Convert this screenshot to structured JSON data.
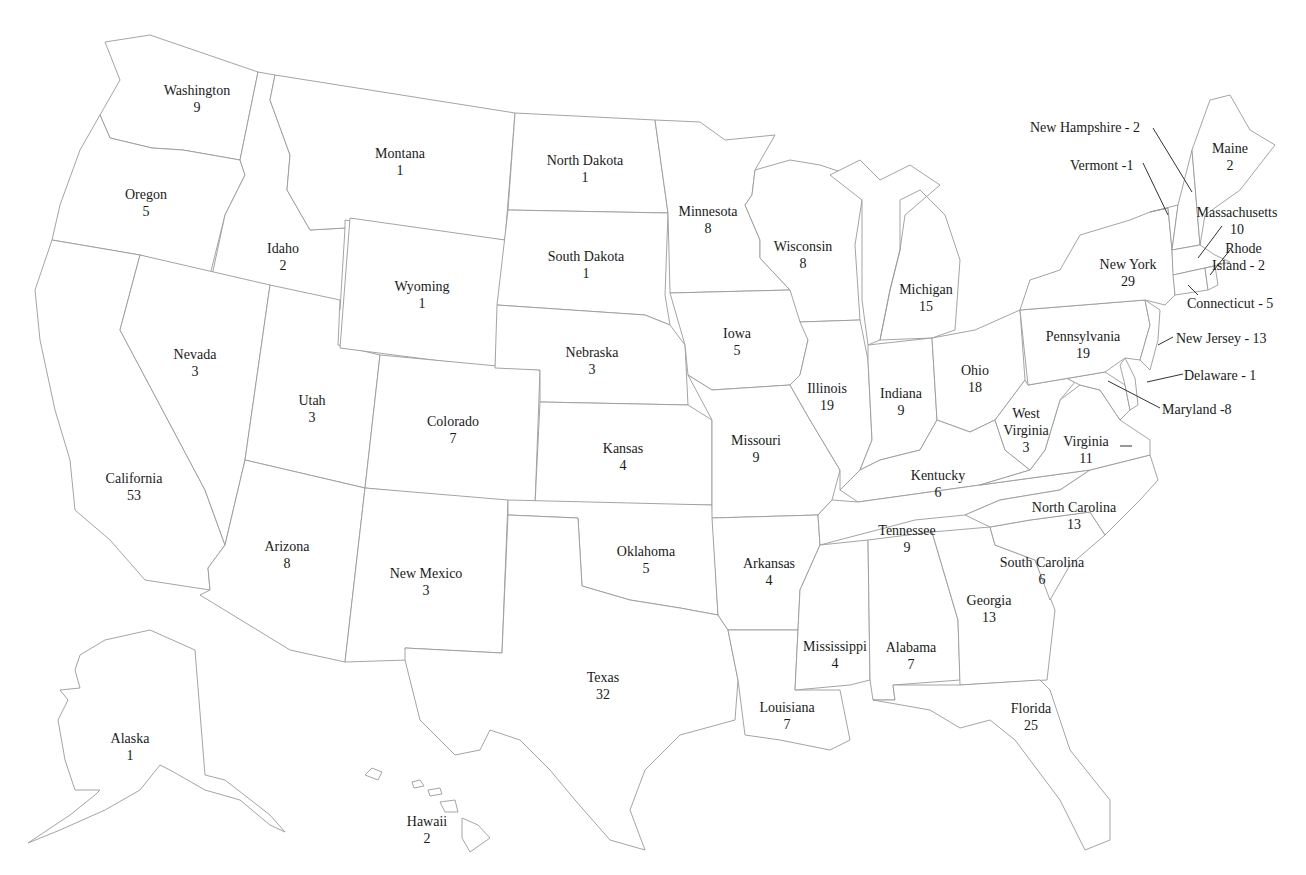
{
  "map": {
    "title": "US Electoral Votes by State",
    "states": [
      {
        "id": "WA",
        "name": "Washington",
        "votes": "9",
        "x": 197,
        "y": 82
      },
      {
        "id": "OR",
        "name": "Oregon",
        "votes": "5",
        "x": 146,
        "y": 186
      },
      {
        "id": "ID",
        "name": "Idaho",
        "votes": "2",
        "x": 283,
        "y": 240
      },
      {
        "id": "MT",
        "name": "Montana",
        "votes": "1",
        "x": 400,
        "y": 145
      },
      {
        "id": "WY",
        "name": "Wyoming",
        "votes": "1",
        "x": 422,
        "y": 278
      },
      {
        "id": "ND",
        "name": "North Dakota",
        "votes": "1",
        "x": 585,
        "y": 152
      },
      {
        "id": "SD",
        "name": "South Dakota",
        "votes": "1",
        "x": 586,
        "y": 248
      },
      {
        "id": "NE",
        "name": "Nebraska",
        "votes": "3",
        "x": 592,
        "y": 344
      },
      {
        "id": "MN",
        "name": "Minnesota",
        "votes": "8",
        "x": 708,
        "y": 203
      },
      {
        "id": "WI",
        "name": "Wisconsin",
        "votes": "8",
        "x": 803,
        "y": 238
      },
      {
        "id": "MI",
        "name": "Michigan",
        "votes": "15",
        "x": 926,
        "y": 281
      },
      {
        "id": "IA",
        "name": "Iowa",
        "votes": "5",
        "x": 737,
        "y": 325
      },
      {
        "id": "IL",
        "name": "Illinois",
        "votes": "19",
        "x": 827,
        "y": 380
      },
      {
        "id": "IN",
        "name": "Indiana",
        "votes": "9",
        "x": 901,
        "y": 385
      },
      {
        "id": "OH",
        "name": "Ohio",
        "votes": "18",
        "x": 975,
        "y": 362
      },
      {
        "id": "NV",
        "name": "Nevada",
        "votes": "3",
        "x": 195,
        "y": 346
      },
      {
        "id": "UT",
        "name": "Utah",
        "votes": "3",
        "x": 312,
        "y": 392
      },
      {
        "id": "CO",
        "name": "Colorado",
        "votes": "7",
        "x": 453,
        "y": 413
      },
      {
        "id": "KS",
        "name": "Kansas",
        "votes": "4",
        "x": 623,
        "y": 440
      },
      {
        "id": "MO",
        "name": "Missouri",
        "votes": "9",
        "x": 756,
        "y": 432
      },
      {
        "id": "CA",
        "name": "California",
        "votes": "53",
        "x": 134,
        "y": 470
      },
      {
        "id": "AZ",
        "name": "Arizona",
        "votes": "8",
        "x": 287,
        "y": 538
      },
      {
        "id": "NM",
        "name": "New Mexico",
        "votes": "3",
        "x": 426,
        "y": 565
      },
      {
        "id": "OK",
        "name": "Oklahoma",
        "votes": "5",
        "x": 646,
        "y": 543
      },
      {
        "id": "AR",
        "name": "Arkansas",
        "votes": "4",
        "x": 769,
        "y": 555
      },
      {
        "id": "TX",
        "name": "Texas",
        "votes": "32",
        "x": 603,
        "y": 669
      },
      {
        "id": "LA",
        "name": "Louisiana",
        "votes": "7",
        "x": 787,
        "y": 699
      },
      {
        "id": "MS",
        "name": "Mississippi",
        "votes": "4",
        "x": 835,
        "y": 638
      },
      {
        "id": "AL",
        "name": "Alabama",
        "votes": "7",
        "x": 911,
        "y": 639
      },
      {
        "id": "GA",
        "name": "Georgia",
        "votes": "13",
        "x": 989,
        "y": 592
      },
      {
        "id": "FL",
        "name": "Florida",
        "votes": "25",
        "x": 1031,
        "y": 700
      },
      {
        "id": "TN",
        "name": "Tennessee",
        "votes": "9",
        "x": 907,
        "y": 522
      },
      {
        "id": "KY",
        "name": "Kentucky",
        "votes": "6",
        "x": 938,
        "y": 467
      },
      {
        "id": "WV",
        "name": "West Virginia",
        "votes": "3",
        "x": 1026,
        "y": 405
      },
      {
        "id": "VA",
        "name": "Virginia",
        "votes": "11",
        "x": 1086,
        "y": 433
      },
      {
        "id": "NC",
        "name": "North Carolina",
        "votes": "13",
        "x": 1074,
        "y": 499
      },
      {
        "id": "SC",
        "name": "South Carolina",
        "votes": "6",
        "x": 1042,
        "y": 554
      },
      {
        "id": "PA",
        "name": "Pennsylvania",
        "votes": "19",
        "x": 1083,
        "y": 328
      },
      {
        "id": "NY",
        "name": "New York",
        "votes": "29",
        "x": 1128,
        "y": 256
      },
      {
        "id": "ME",
        "name": "Maine",
        "votes": "2",
        "x": 1230,
        "y": 140
      },
      {
        "id": "MA",
        "name": "Massachusetts",
        "votes": "10",
        "x": 1237,
        "y": 204
      },
      {
        "id": "AK",
        "name": "Alaka_placeholder",
        "votes": "1",
        "x": 130,
        "y": 730
      },
      {
        "id": "HI",
        "name": "Hawaii",
        "votes": "2",
        "x": 427,
        "y": 813
      }
    ],
    "callouts": [
      {
        "id": "NH",
        "text": "New Hampshire - 2",
        "x": 1030,
        "y": 119
      },
      {
        "id": "VT",
        "text": "Vermont -1",
        "x": 1070,
        "y": 157
      },
      {
        "id": "RI",
        "text": "Rhode Island - 2",
        "line1": "Rhode",
        "line2": "Island - 2",
        "x": 1230,
        "y": 240
      },
      {
        "id": "CT",
        "text": "Connecticut - 5",
        "x": 1187,
        "y": 295
      },
      {
        "id": "NJ",
        "text": "New Jersey - 13",
        "x": 1176,
        "y": 330
      },
      {
        "id": "DE",
        "text": "Delaware - 1",
        "x": 1184,
        "y": 367
      },
      {
        "id": "MD",
        "text": "Maryland -8",
        "x": 1162,
        "y": 401
      }
    ],
    "colors": {
      "background": "#ffffff",
      "border": "#9a9a9a",
      "text": "#1a1a1a"
    }
  }
}
